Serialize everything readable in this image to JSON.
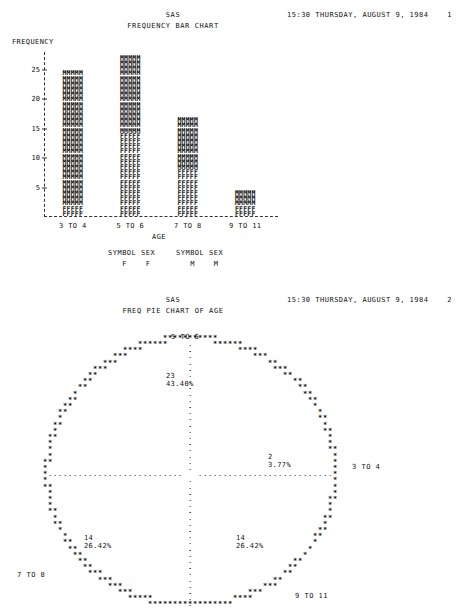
{
  "pages": [
    {
      "system_title": "SAS",
      "report_title": "FREQUENCY BAR CHART",
      "timestamp": "15:30 THURSDAY, AUGUST 9, 1984    1"
    },
    {
      "system_title": "SAS",
      "report_title": "FREQ PIE CHART OF AGE",
      "timestamp": "15:30 THURSDAY, AUGUST 9, 1984    2"
    }
  ],
  "barchart": {
    "y_axis_title": "FREQUENCY",
    "x_axis_title": "AGE",
    "legend": [
      {
        "symbol_header": "SYMBOL",
        "sex_header": "SEX",
        "symbol": "F",
        "sex": "F"
      },
      {
        "symbol_header": "SYMBOL",
        "sex_header": "SEX",
        "symbol": "M",
        "sex": "M"
      }
    ]
  },
  "pie": {
    "slice_fill_char": "*",
    "divider_char": ".",
    "labels": {
      "top": "5 TO 6",
      "right": "3 TO 4",
      "bottom_left": "7 TO 8",
      "bottom_right": "9 TO 11"
    }
  },
  "chart_data": [
    {
      "type": "bar",
      "title": "FREQUENCY BAR CHART",
      "subtype": "stacked-ascii-bar",
      "xlabel": "AGE",
      "ylabel": "FREQUENCY",
      "ylim": [
        0,
        28
      ],
      "yticks": [
        5,
        10,
        15,
        20,
        25
      ],
      "grid": false,
      "legend_position": "below",
      "categories": [
        "3 TO 4",
        "5 TO 6",
        "7 TO 8",
        "9 TO 11"
      ],
      "series": [
        {
          "name": "F",
          "symbol": "F",
          "values": [
            2,
            14,
            8,
            2
          ]
        },
        {
          "name": "M",
          "symbol": "M",
          "values": [
            23,
            13,
            9,
            3
          ]
        }
      ],
      "totals": [
        25,
        27,
        17,
        5
      ]
    },
    {
      "type": "pie",
      "title": "FREQ PIE CHART OF AGE",
      "total": 53,
      "slices": [
        {
          "label": "5 TO 6",
          "value": 23,
          "percent": "43.40%",
          "percent_value": 43.4
        },
        {
          "label": "3 TO 4",
          "value": 2,
          "percent": "3.77%",
          "percent_value": 3.77
        },
        {
          "label": "9 TO 11",
          "value": 14,
          "percent": "26.42%",
          "percent_value": 26.42
        },
        {
          "label": "7 TO 8",
          "value": 14,
          "percent": "26.42%",
          "percent_value": 26.42
        }
      ]
    }
  ]
}
